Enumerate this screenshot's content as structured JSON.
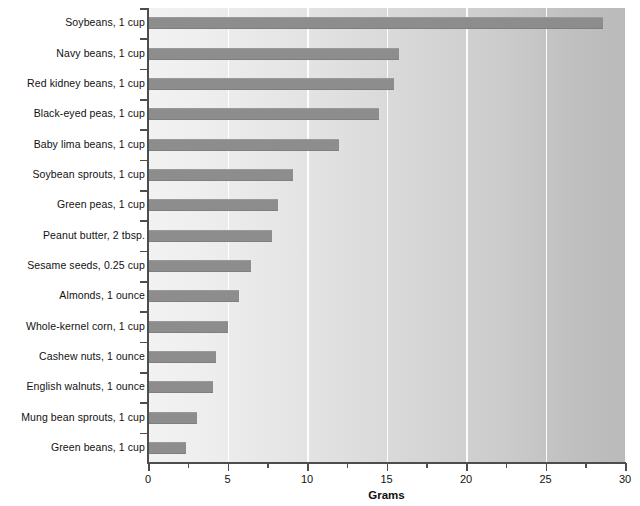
{
  "chart_data": {
    "type": "bar",
    "orientation": "horizontal",
    "title": "",
    "xlabel": "Grams",
    "ylabel": "",
    "xlim": [
      0,
      30
    ],
    "ylim": null,
    "grid": "vertical-major",
    "legend": null,
    "bar_color": "#8d8d8d",
    "axis_color": "#4d4d4d",
    "xticks": [
      0,
      5,
      10,
      15,
      20,
      25,
      30
    ],
    "xtick_labels": [
      "0",
      "5",
      "10",
      "15",
      "20",
      "25",
      "30"
    ],
    "xminorticks": [
      2.5,
      7.5,
      12.5,
      17.5,
      22.5,
      27.5
    ],
    "categories": [
      "Soybeans, 1 cup",
      "Navy beans, 1 cup",
      "Red kidney beans, 1 cup",
      "Black-eyed peas, 1 cup",
      "Baby lima beans, 1 cup",
      "Soybean sprouts, 1 cup",
      "Green peas, 1 cup",
      "Peanut butter, 2 tbsp.",
      "Sesame seeds, 0.25 cup",
      "Almonds, 1 ounce",
      "Whole-kernel corn, 1 cup",
      "Cashew nuts, 1 ounce",
      "English walnuts, 1 ounce",
      "Mung bean sprouts, 1 cup",
      "Green beans, 1 cup"
    ],
    "values": [
      28.6,
      15.8,
      15.5,
      14.5,
      12.0,
      9.1,
      8.2,
      7.8,
      6.5,
      5.7,
      5.0,
      4.3,
      4.1,
      3.1,
      2.4
    ]
  }
}
